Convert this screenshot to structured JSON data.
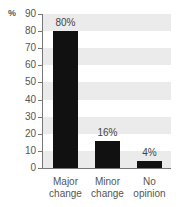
{
  "chart_data": {
    "type": "bar",
    "title": "",
    "xlabel": "",
    "ylabel": "%",
    "ylim": [
      0,
      90
    ],
    "yticks": [
      0,
      10,
      20,
      30,
      40,
      50,
      60,
      70,
      80,
      90
    ],
    "categories": [
      "Major change",
      "Minor change",
      "No opinion"
    ],
    "category_lines": [
      [
        "Major",
        "change"
      ],
      [
        "Minor",
        "change"
      ],
      [
        "No",
        "opinion"
      ]
    ],
    "values": [
      80,
      16,
      4
    ],
    "value_labels": [
      "80%",
      "16%",
      "4%"
    ],
    "grid": "alternating horizontal bands",
    "legend": "none",
    "bar_color": "#111111",
    "band_color": "#ebebeb"
  },
  "axis": {
    "unit_label": "%"
  }
}
